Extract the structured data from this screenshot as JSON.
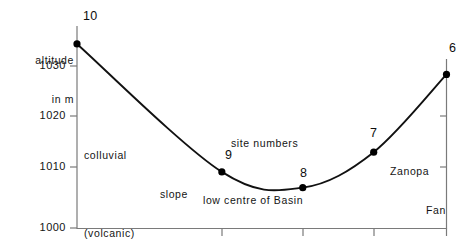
{
  "chart_data": {
    "type": "line",
    "title": "",
    "subtitle": "",
    "xlabel": "",
    "ylabel": "altitude in m",
    "ylabel_line1": "altitude",
    "ylabel_line2": "in m",
    "ylim": [
      1000,
      1042
    ],
    "xlim": [
      0,
      100
    ],
    "grid": false,
    "legend": "none",
    "y_ticks": [
      1030,
      1020,
      1010,
      1000
    ],
    "y_tick_labels": [
      "1030",
      "1020",
      "1010",
      "1000"
    ],
    "right_axis_ticks": [
      1020,
      1010
    ],
    "x_tick_positions": [
      38.4,
      60.2,
      78.7,
      100.0
    ],
    "point_label_name": "site numbers",
    "series": [
      {
        "name": "altitude profile",
        "points": [
          {
            "site": "10",
            "x": 0.0,
            "y": 1037.5,
            "label": "10"
          },
          {
            "site": "9",
            "x": 39.2,
            "y": 1011.5,
            "label": "9"
          },
          {
            "site": "8",
            "x": 61.1,
            "y": 1008.3,
            "label": "8"
          },
          {
            "site": "7",
            "x": 80.3,
            "y": 1015.5,
            "label": "7"
          },
          {
            "site": "6",
            "x": 100.0,
            "y": 1031.3,
            "label": "6"
          }
        ]
      }
    ],
    "annotations": [
      {
        "id": "colluvial",
        "text": "colluvial\n      slope\n(volcanic)",
        "x": 12,
        "y": 1020
      },
      {
        "id": "site-numbers",
        "text": "site numbers",
        "x": 47,
        "y": 1017
      },
      {
        "id": "low-centre",
        "text": "low centre of Basin",
        "x": 57,
        "y": 1005
      },
      {
        "id": "zanopa-fan",
        "text": "Zanopa\n   Fan",
        "x": 90,
        "y": 1014
      }
    ],
    "colors": {
      "curve": "#111111",
      "axis": "#6b6b6b",
      "marker": "#000000",
      "background": "#ffffff",
      "text": "#141414"
    }
  },
  "labels": {
    "y_tick_1030": "1030",
    "y_tick_1020": "1020",
    "y_tick_1010": "1010",
    "y_tick_1000": "1000",
    "axis_title_l1": "altitude",
    "axis_title_l2": "in m",
    "anno_colluvial_l1": "colluvial",
    "anno_colluvial_l2": "slope",
    "anno_colluvial_l3": "(volcanic)",
    "anno_site_numbers": "site numbers",
    "anno_low_centre": "low centre of Basin",
    "anno_zanopa_l1": "Zanopa",
    "anno_zanopa_l2": "Fan",
    "pt_10": "10",
    "pt_9": "9",
    "pt_8": "8",
    "pt_7": "7",
    "pt_6": "6"
  }
}
